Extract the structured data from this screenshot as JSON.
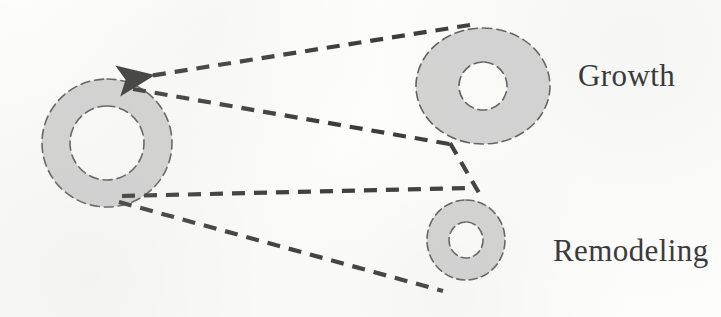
{
  "figure": {
    "background_color": "#fdfdfc",
    "ring_fill_color": "#d3d3d3",
    "ring_stroke_color": "#6b6b6b",
    "line_color": "#3b3b3b",
    "label_color": "#3a3a3c"
  },
  "labels": {
    "growth": "Growth",
    "remodeling": "Remodeling"
  },
  "shapes": {
    "source_ring": {
      "name": "baseline-vessel-cross-section",
      "cx": 107,
      "cy": 143,
      "outer_rx": 65,
      "outer_ry": 64,
      "inner_rx": 37,
      "inner_ry": 37
    },
    "growth_ring": {
      "name": "growth-vessel-cross-section",
      "cx": 483,
      "cy": 86,
      "outer_rx": 67,
      "outer_ry": 58,
      "inner_rx": 24,
      "inner_ry": 24
    },
    "remodeling_ring": {
      "name": "remodeling-vessel-cross-section",
      "cx": 466,
      "cy": 240,
      "outer_rx": 39,
      "outer_ry": 40,
      "inner_rx": 17,
      "inner_ry": 18
    }
  },
  "connectors": [
    {
      "name": "growth-to-source-arrow",
      "from": [
        470,
        25
      ],
      "to": [
        118,
        81
      ],
      "arrowhead_at": "to",
      "style": "dashed"
    },
    {
      "name": "source-to-growth-lower",
      "from": [
        133,
        89
      ],
      "to": [
        455,
        145
      ],
      "arrowhead_at": "none",
      "style": "dashed"
    },
    {
      "name": "growth-lower-to-remodeling",
      "from": [
        455,
        146
      ],
      "to": [
        478,
        192
      ],
      "arrowhead_at": "none",
      "style": "dashed"
    },
    {
      "name": "source-to-remodeling-upper",
      "from": [
        122,
        196
      ],
      "to": [
        470,
        188
      ],
      "arrowhead_at": "none",
      "style": "dashed"
    },
    {
      "name": "source-to-remodeling-lower",
      "from": [
        119,
        202
      ],
      "to": [
        443,
        291
      ],
      "arrowhead_at": "none",
      "style": "dashed"
    }
  ]
}
